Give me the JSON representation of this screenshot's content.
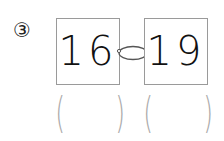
{
  "problem": {
    "label": "③",
    "cards": [
      {
        "value": "16"
      },
      {
        "value": "19"
      }
    ],
    "connector": "ring-link-icon",
    "answers": [
      {
        "open": "(",
        "close": ")",
        "value": ""
      },
      {
        "open": "(",
        "close": ")",
        "value": ""
      }
    ]
  }
}
